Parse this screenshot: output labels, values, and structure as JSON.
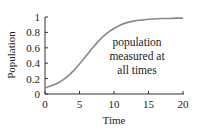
{
  "chart_data": {
    "type": "line",
    "title": "",
    "xlabel": "Time",
    "ylabel": "Population",
    "xlim": [
      0,
      20
    ],
    "ylim": [
      0,
      1
    ],
    "xticks": [
      "0",
      "5",
      "10",
      "15",
      "20"
    ],
    "yticks": [
      "0",
      "0.2",
      "0.4",
      "0.6",
      "0.8",
      "1"
    ],
    "grid": false,
    "legend": null,
    "series": [
      {
        "name": "population",
        "color": "#888888",
        "x": [
          0,
          1,
          2,
          3,
          4,
          5,
          6,
          7,
          8,
          9,
          10,
          11,
          12,
          13,
          14,
          15,
          16,
          17,
          18,
          19,
          20
        ],
        "y": [
          0.08,
          0.11,
          0.15,
          0.21,
          0.29,
          0.39,
          0.5,
          0.61,
          0.71,
          0.79,
          0.85,
          0.9,
          0.93,
          0.95,
          0.96,
          0.97,
          0.975,
          0.98,
          0.98,
          0.985,
          0.985
        ]
      }
    ],
    "annotations": [
      {
        "text": [
          "population",
          "measured at",
          "all times"
        ],
        "x": 12.5,
        "y": 0.5
      }
    ]
  }
}
